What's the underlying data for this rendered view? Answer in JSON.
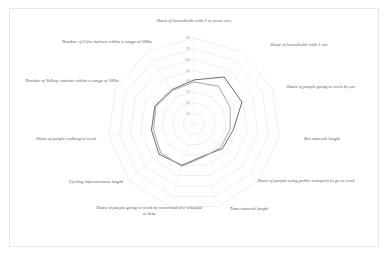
{
  "chart_data": {
    "type": "radar",
    "title": "",
    "subtitle": "",
    "xlabel": "",
    "ylabel": "",
    "grid": true,
    "legend_position": "none",
    "rings": 8,
    "rlim": [
      0,
      80
    ],
    "tick_labels": [
      "10",
      "20",
      "30",
      "40",
      "50",
      "60",
      "70",
      "80"
    ],
    "tick_values": [
      10,
      20,
      30,
      40,
      50,
      60,
      70,
      80
    ],
    "categories": [
      "Share of households with 2 or more cars",
      "Share of households with 1 car",
      "Share of people going to work by car",
      "Bus network length",
      "Share of people using public transport to go to work",
      "Tram network length",
      "Share of people going to work by motorized two-wheeled or bike",
      "Cycling infrastructure length",
      "Share of people walking to work",
      "Number of Velhop stations within a range of 500m",
      "Number of Citiz stations within a range of 500m"
    ],
    "series": [
      {
        "name": "Series 1",
        "color": "#6e6e6e",
        "values": [
          41,
          52,
          49,
          37,
          35,
          31,
          40,
          43,
          40,
          40,
          38
        ]
      },
      {
        "name": "Series 2",
        "color": "#a8a8a8",
        "values": [
          39,
          42,
          37,
          34,
          33,
          32,
          41,
          41,
          38,
          39,
          37
        ]
      }
    ]
  },
  "labels": {
    "top": "Share of households with 2 or more cars",
    "upper_right": "Share of households with 1 car",
    "right": "Share of people going to work by car",
    "lower_right_1": "Bus network length",
    "lower_right_2": "Share of people using public transport to go to work",
    "bottom_right": "Tram network length",
    "bottom": "Share of people going to work by motorized two-wheeled or bike",
    "bottom_left": "Cycling infrastructure length",
    "left_lower": "Share of people walking to work",
    "left": "Number of Velhop stations within a range of 500m",
    "upper_left": "Number of Citiz stations within a range of 500m"
  }
}
